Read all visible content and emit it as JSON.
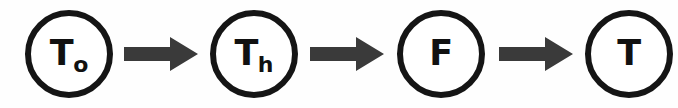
{
  "diagram": {
    "type": "flow-chain",
    "orientation": "horizontal",
    "background_color": "#fefefe",
    "node_stroke_color": "#151515",
    "node_fill_color": "#ffffff",
    "label_color": "#111111",
    "arrow_color": "#3a3a3a",
    "nodes": [
      {
        "id": "node-1",
        "label_main": "T",
        "label_sub": "o",
        "shape": "circle"
      },
      {
        "id": "node-2",
        "label_main": "T",
        "label_sub": "h",
        "shape": "circle"
      },
      {
        "id": "node-3",
        "label_main": "F",
        "label_sub": "",
        "shape": "circle"
      },
      {
        "id": "node-4",
        "label_main": "T",
        "label_sub": "",
        "shape": "circle"
      }
    ],
    "connectors": [
      {
        "id": "arrow-1",
        "from": "node-1",
        "to": "node-2",
        "style": "solid-block-arrow",
        "direction": "right"
      },
      {
        "id": "arrow-2",
        "from": "node-2",
        "to": "node-3",
        "style": "solid-block-arrow",
        "direction": "right"
      },
      {
        "id": "arrow-3",
        "from": "node-3",
        "to": "node-4",
        "style": "solid-block-arrow",
        "direction": "right"
      }
    ]
  }
}
